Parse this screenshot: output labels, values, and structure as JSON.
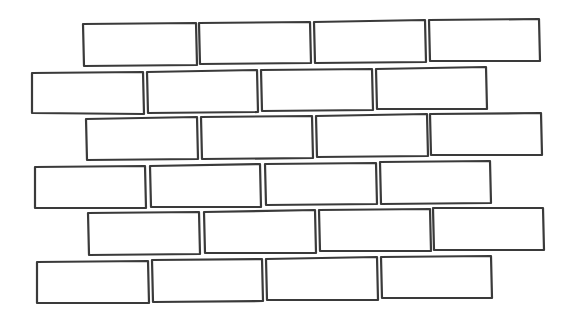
{
  "drawing": {
    "subject": "brick-wall-outline",
    "stroke_color": "#3a3a3a",
    "background_color": "#ffffff",
    "rows": [
      {
        "bricks": [
          [
            83,
            24,
            196,
            23,
            197,
            65,
            84,
            66
          ],
          [
            199,
            23,
            310,
            22,
            311,
            63,
            200,
            64
          ],
          [
            314,
            22,
            425,
            20,
            426,
            62,
            315,
            63
          ],
          [
            429,
            20,
            539,
            19,
            540,
            61,
            430,
            61
          ]
        ]
      },
      {
        "bricks": [
          [
            32,
            73,
            143,
            72,
            144,
            114,
            32,
            113
          ],
          [
            147,
            72,
            257,
            70,
            258,
            112,
            148,
            113
          ],
          [
            261,
            70,
            372,
            69,
            373,
            110,
            262,
            111
          ],
          [
            376,
            69,
            486,
            67,
            487,
            109,
            377,
            109
          ]
        ]
      },
      {
        "bricks": [
          [
            86,
            119,
            197,
            117,
            198,
            159,
            87,
            160
          ],
          [
            201,
            117,
            312,
            116,
            313,
            158,
            202,
            159
          ],
          [
            316,
            116,
            427,
            114,
            428,
            156,
            317,
            157
          ],
          [
            430,
            114,
            541,
            113,
            542,
            155,
            431,
            155
          ]
        ]
      },
      {
        "bricks": [
          [
            35,
            167,
            145,
            166,
            146,
            208,
            35,
            208
          ],
          [
            150,
            166,
            260,
            164,
            261,
            207,
            151,
            207
          ],
          [
            265,
            164,
            376,
            163,
            377,
            204,
            266,
            205
          ],
          [
            380,
            162,
            490,
            161,
            491,
            203,
            381,
            204
          ]
        ]
      },
      {
        "bricks": [
          [
            88,
            213,
            199,
            212,
            200,
            254,
            89,
            255
          ],
          [
            204,
            212,
            315,
            210,
            316,
            253,
            205,
            253
          ],
          [
            319,
            210,
            430,
            209,
            431,
            251,
            320,
            251
          ],
          [
            433,
            208,
            543,
            208,
            544,
            250,
            434,
            250
          ]
        ]
      },
      {
        "bricks": [
          [
            37,
            262,
            148,
            261,
            149,
            303,
            37,
            303
          ],
          [
            152,
            260,
            262,
            259,
            263,
            301,
            153,
            302
          ],
          [
            266,
            259,
            377,
            257,
            378,
            300,
            267,
            300
          ],
          [
            381,
            257,
            491,
            256,
            492,
            298,
            382,
            298
          ]
        ]
      }
    ]
  }
}
